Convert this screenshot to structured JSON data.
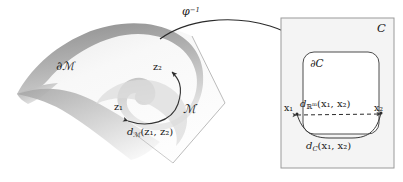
{
  "figure": {
    "width": 403,
    "height": 182,
    "background_color": "#ffffff"
  },
  "colors": {
    "ink": "#1a1a1a",
    "stroke": "#3a3a3a",
    "panel_fill": "#f4f4f4",
    "panel_border": "#9a9a9a",
    "manifold_light": "#fcfcfc",
    "manifold_mid": "#c9c9c9",
    "manifold_dark": "#8f8f8f",
    "sheet_edge": "#b0b0b0"
  },
  "manifold_side": {
    "surface_name": "manifold-surface",
    "manifold_label": "ℳ",
    "boundary_label": "∂ℳ",
    "point_1_label": "z₁",
    "point_2_label": "z₂",
    "geodesic_label_base": "d",
    "geodesic_label_sub": "ℳ",
    "geodesic_label_args": "(z₁, z₂)",
    "geodesic_label_full": "dℳ(z₁, z₂)"
  },
  "mapping": {
    "arrow_name": "phi-inverse-arrow",
    "label_base": "φ",
    "label_sup": "−1",
    "label_full": "φ⁻¹"
  },
  "chart_side": {
    "panel_name": "chart-domain-panel",
    "chart_label": "𝒞",
    "chart_label_plain": "C",
    "region_boundary_label": "∂𝒞",
    "region_boundary_plain": "∂C",
    "point_1_label": "x₁",
    "point_2_label": "x₂",
    "euclidean_label_base": "d",
    "euclidean_label_sub": "ℝ",
    "euclidean_label_sub_sup": "m",
    "euclidean_label_args": "(x₁, x₂)",
    "euclidean_label_full": "dℝᵐ(x₁, x₂)",
    "intrinsic_label_base": "d",
    "intrinsic_label_sub": "𝒞",
    "intrinsic_label_sub_plain": "C",
    "intrinsic_label_args": "(x₁, x₂)",
    "intrinsic_label_full": "d𝒞(x₁, x₂)"
  }
}
